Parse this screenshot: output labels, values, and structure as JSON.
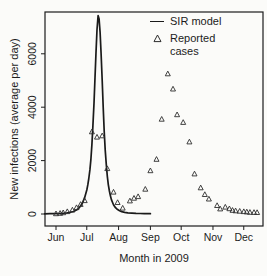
{
  "figure": {
    "xlabel": "Month in 2009",
    "ylabel": "New infections (average per day)",
    "legend": {
      "line_label": "SIR model",
      "scatter_label_line1": "Reported",
      "scatter_label_line2": "cases"
    }
  },
  "colors": {
    "axis": "#1c1c1c",
    "line": "#1a1a1a",
    "marker": "#2e2e2e",
    "background": "#fbfbf9"
  },
  "chart_data": {
    "type": "line",
    "title": "",
    "xlabel": "Month in 2009",
    "ylabel": "New infections (average per day)",
    "x_unit": "days since Jun 1 2009",
    "x_ticks": [
      {
        "label": "Jun",
        "day": 0
      },
      {
        "label": "Jul",
        "day": 30
      },
      {
        "label": "Aug",
        "day": 61
      },
      {
        "label": "Sep",
        "day": 92
      },
      {
        "label": "Oct",
        "day": 122
      },
      {
        "label": "Nov",
        "day": 153
      },
      {
        "label": "Dec",
        "day": 183
      }
    ],
    "x_range_days": [
      -11,
      202
    ],
    "y_ticks": [
      0,
      2000,
      4000,
      6000
    ],
    "ylim": [
      0,
      7600
    ],
    "grid": false,
    "legend_position": "top-right",
    "series": [
      {
        "name": "SIR model",
        "type": "line",
        "color": "#1a1a1a",
        "peak": {
          "day": 41,
          "value": 7430
        },
        "points": [
          [
            -11,
            8
          ],
          [
            -6,
            10
          ],
          [
            0,
            14
          ],
          [
            5,
            22
          ],
          [
            10,
            38
          ],
          [
            14,
            62
          ],
          [
            17,
            95
          ],
          [
            20,
            150
          ],
          [
            22,
            210
          ],
          [
            24,
            300
          ],
          [
            26,
            430
          ],
          [
            28,
            620
          ],
          [
            30,
            900
          ],
          [
            31,
            1090
          ],
          [
            32,
            1330
          ],
          [
            33,
            1650
          ],
          [
            34,
            2050
          ],
          [
            35,
            2600
          ],
          [
            36,
            3300
          ],
          [
            37,
            4150
          ],
          [
            38,
            5100
          ],
          [
            39,
            6050
          ],
          [
            40,
            6900
          ],
          [
            41,
            7430
          ],
          [
            42,
            7300
          ],
          [
            43,
            6800
          ],
          [
            44,
            6000
          ],
          [
            45,
            5000
          ],
          [
            46,
            4000
          ],
          [
            47,
            3100
          ],
          [
            48,
            2400
          ],
          [
            49,
            1850
          ],
          [
            50,
            1420
          ],
          [
            51,
            1100
          ],
          [
            52,
            860
          ],
          [
            53,
            680
          ],
          [
            54,
            540
          ],
          [
            56,
            350
          ],
          [
            58,
            235
          ],
          [
            60,
            165
          ],
          [
            62,
            120
          ],
          [
            64,
            90
          ],
          [
            67,
            62
          ],
          [
            70,
            45
          ],
          [
            74,
            32
          ],
          [
            78,
            24
          ],
          [
            82,
            19
          ],
          [
            86,
            16
          ],
          [
            90,
            13
          ],
          [
            92,
            12
          ]
        ]
      },
      {
        "name": "Reported cases",
        "type": "scatter",
        "marker": "triangle-open",
        "color": "#2e2e2e",
        "points": [
          [
            0,
            10
          ],
          [
            4,
            25
          ],
          [
            7,
            50
          ],
          [
            11,
            90
          ],
          [
            16,
            150
          ],
          [
            20,
            240
          ],
          [
            24,
            360
          ],
          [
            28,
            500
          ],
          [
            35,
            3080
          ],
          [
            40,
            2880
          ],
          [
            45,
            2930
          ],
          [
            50,
            1700
          ],
          [
            56,
            820
          ],
          [
            60,
            430
          ],
          [
            65,
            220
          ],
          [
            72,
            490
          ],
          [
            76,
            590
          ],
          [
            80,
            650
          ],
          [
            87,
            930
          ],
          [
            92,
            1620
          ],
          [
            98,
            2050
          ],
          [
            103,
            3550
          ],
          [
            109,
            5250
          ],
          [
            114,
            4680
          ],
          [
            118,
            3720
          ],
          [
            124,
            3430
          ],
          [
            130,
            2700
          ],
          [
            135,
            1500
          ],
          [
            141,
            980
          ],
          [
            145,
            730
          ],
          [
            149,
            560
          ],
          [
            157,
            320
          ],
          [
            160,
            190
          ],
          [
            165,
            260
          ],
          [
            169,
            200
          ],
          [
            172,
            140
          ],
          [
            175,
            120
          ],
          [
            179,
            105
          ],
          [
            183,
            90
          ],
          [
            186,
            80
          ],
          [
            189,
            65
          ],
          [
            193,
            60
          ],
          [
            196,
            55
          ]
        ]
      }
    ]
  }
}
